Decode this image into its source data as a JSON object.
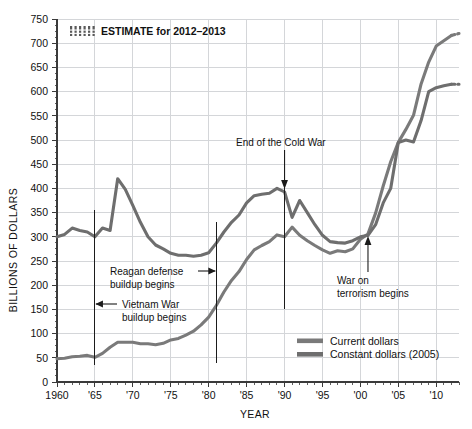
{
  "chart_data": {
    "type": "line",
    "title": "",
    "xlabel": "YEAR",
    "ylabel": "BILLIONS OF DOLLARS",
    "xlim": [
      1960,
      2013
    ],
    "ylim": [
      0,
      750
    ],
    "grid": true,
    "legend_position": "bottom-right",
    "y_ticks": [
      0,
      50,
      100,
      150,
      200,
      250,
      300,
      350,
      400,
      450,
      500,
      550,
      600,
      650,
      700,
      750
    ],
    "x_ticks": [
      1960,
      1965,
      1970,
      1975,
      1980,
      1985,
      1990,
      1995,
      2000,
      2005,
      2010
    ],
    "x_tick_labels": [
      "1960",
      "'65",
      "'70",
      "'75",
      "'80",
      "'85",
      "'90",
      "'95",
      "'00",
      "'05",
      "'10"
    ],
    "series": [
      {
        "name": "Current dollars",
        "color": "#7a7a7a",
        "x": [
          1960,
          1961,
          1962,
          1963,
          1964,
          1965,
          1966,
          1967,
          1968,
          1969,
          1970,
          1971,
          1972,
          1973,
          1974,
          1975,
          1976,
          1977,
          1978,
          1979,
          1980,
          1981,
          1982,
          1983,
          1984,
          1985,
          1986,
          1987,
          1988,
          1989,
          1990,
          1991,
          1992,
          1993,
          1994,
          1995,
          1996,
          1997,
          1998,
          1999,
          2000,
          2001,
          2002,
          2003,
          2004,
          2005,
          2006,
          2007,
          2008,
          2009,
          2010,
          2011,
          2012,
          2013
        ],
        "values": [
          48,
          49,
          52,
          53,
          55,
          51,
          59,
          72,
          82,
          82,
          82,
          79,
          79,
          77,
          80,
          87,
          90,
          97,
          105,
          118,
          134,
          158,
          186,
          210,
          228,
          253,
          273,
          282,
          290,
          304,
          300,
          320,
          303,
          292,
          282,
          273,
          266,
          271,
          269,
          275,
          295,
          306,
          349,
          405,
          455,
          495,
          522,
          551,
          616,
          661,
          694,
          705,
          716,
          720
        ],
        "estimate_from": 2012
      },
      {
        "name": "Constant dollars (2005)",
        "color": "#6e6e6e",
        "x": [
          1960,
          1961,
          1962,
          1963,
          1964,
          1965,
          1966,
          1967,
          1968,
          1969,
          1970,
          1971,
          1972,
          1973,
          1974,
          1975,
          1976,
          1977,
          1978,
          1979,
          1980,
          1981,
          1982,
          1983,
          1984,
          1985,
          1986,
          1987,
          1988,
          1989,
          1990,
          1991,
          1992,
          1993,
          1994,
          1995,
          1996,
          1997,
          1998,
          1999,
          2000,
          2001,
          2002,
          2003,
          2004,
          2005,
          2006,
          2007,
          2008,
          2009,
          2010,
          2011,
          2012,
          2013
        ],
        "values": [
          300,
          305,
          318,
          313,
          310,
          300,
          318,
          313,
          420,
          398,
          365,
          330,
          300,
          283,
          275,
          266,
          262,
          262,
          260,
          262,
          267,
          287,
          310,
          330,
          345,
          370,
          385,
          388,
          390,
          400,
          393,
          340,
          375,
          350,
          325,
          303,
          290,
          288,
          287,
          292,
          300,
          303,
          325,
          370,
          400,
          495,
          500,
          496,
          540,
          600,
          608,
          612,
          615,
          615
        ],
        "estimate_from": 2012
      }
    ],
    "annotations": [
      {
        "id": "estimate-key",
        "label": "ESTIMATE for 2012–2013"
      },
      {
        "id": "reagan",
        "label_line1": "Reagan defense",
        "label_line2": "buildup begins",
        "year": 1981
      },
      {
        "id": "vietnam",
        "label_line1": "Vietnam War",
        "label_line2": "buildup begins",
        "year": 1965
      },
      {
        "id": "cold-war",
        "label_line1": "End of the Cold War",
        "year": 1990
      },
      {
        "id": "terrorism",
        "label_line1": "War on",
        "label_line2": "terrorism begins",
        "year": 2001
      }
    ]
  },
  "legend": {
    "items": [
      {
        "label": "Current dollars"
      },
      {
        "label": "Constant dollars (2005)"
      }
    ]
  },
  "axes": {
    "y_title": "BILLIONS OF DOLLARS",
    "x_title": "YEAR"
  },
  "colors": {
    "current": "#7a7a7a",
    "constant": "#6e6e6e",
    "grid": "#d4d6d9",
    "axis": "#3a3a3a",
    "text": "#111111"
  }
}
